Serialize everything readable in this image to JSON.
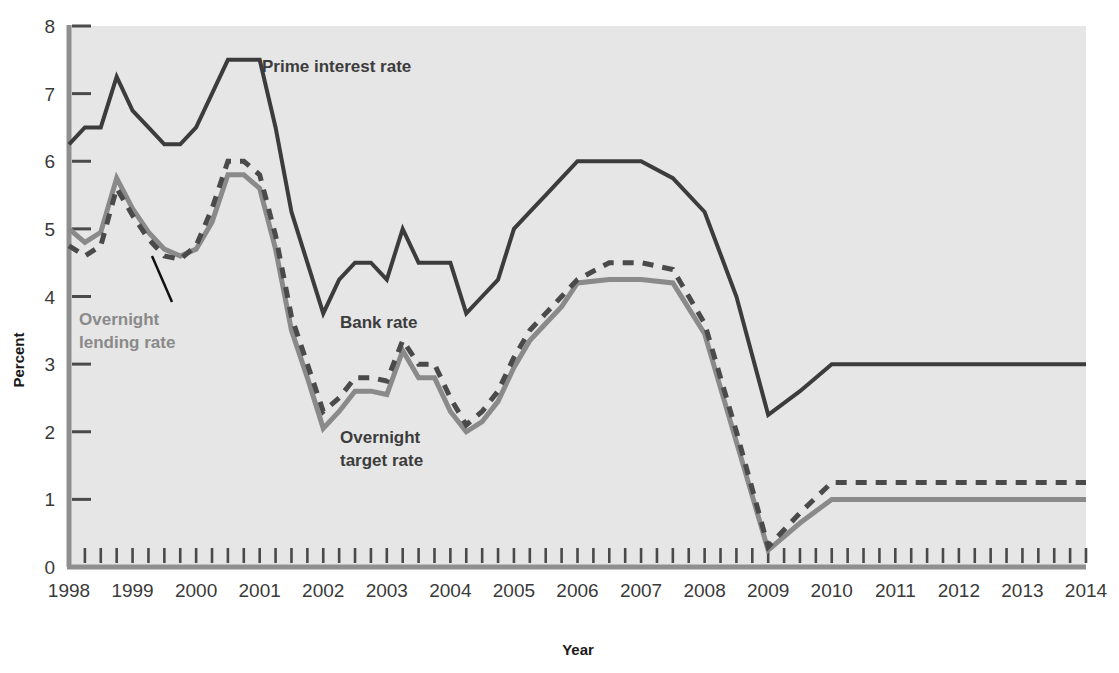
{
  "chart_data": {
    "type": "line",
    "title": "",
    "xlabel": "Year",
    "ylabel": "Percent",
    "xlim": [
      1998,
      2014
    ],
    "ylim": [
      0,
      8
    ],
    "yticks": [
      0,
      1,
      2,
      3,
      4,
      5,
      6,
      7,
      8
    ],
    "xticks": [
      1998,
      1999,
      2000,
      2001,
      2002,
      2003,
      2004,
      2005,
      2006,
      2007,
      2008,
      2009,
      2010,
      2011,
      2012,
      2013,
      2014
    ],
    "xtick_labels": [
      "1998",
      "1999",
      "2000",
      "2001",
      "2002",
      "2003",
      "2004",
      "2005",
      "2006",
      "2007",
      "2008",
      "2009",
      "2010",
      "2011",
      "2012",
      "2013",
      "2014"
    ],
    "ytick_labels": [
      "0",
      "1",
      "2",
      "3",
      "4",
      "5",
      "6",
      "7",
      "8"
    ],
    "minor_xticks_per_year": 4,
    "grid": false,
    "legend_position": "inline-annotations",
    "plot_background": "#e6e6e6",
    "series": [
      {
        "name": "Prime interest rate",
        "style": "solid",
        "color": "#3c3c3c",
        "width": 4,
        "x": [
          1998.0,
          1998.25,
          1998.5,
          1998.75,
          1999.0,
          1999.25,
          1999.5,
          1999.75,
          2000.0,
          2000.25,
          2000.5,
          2000.75,
          2001.0,
          2001.25,
          2001.5,
          2001.75,
          2002.0,
          2002.25,
          2002.5,
          2002.75,
          2003.0,
          2003.25,
          2003.5,
          2003.75,
          2004.0,
          2004.25,
          2004.5,
          2004.75,
          2005.0,
          2005.25,
          2005.5,
          2005.75,
          2006.0,
          2006.5,
          2007.0,
          2007.5,
          2008.0,
          2008.5,
          2009.0,
          2009.5,
          2010.0,
          2014.0
        ],
        "y": [
          6.25,
          6.5,
          6.5,
          7.25,
          6.75,
          6.5,
          6.25,
          6.25,
          6.5,
          7.0,
          7.5,
          7.5,
          7.5,
          6.5,
          5.25,
          4.5,
          3.75,
          4.25,
          4.5,
          4.5,
          4.25,
          5.0,
          4.5,
          4.5,
          4.5,
          3.75,
          4.0,
          4.25,
          5.0,
          5.25,
          5.5,
          5.75,
          6.0,
          6.0,
          6.0,
          5.75,
          5.25,
          4.0,
          2.25,
          2.6,
          3.0,
          3.0
        ]
      },
      {
        "name": "Bank rate",
        "style": "dashed",
        "color": "#4a4a4a",
        "width": 5,
        "x": [
          1998.0,
          1998.25,
          1998.5,
          1998.75,
          1999.0,
          1999.25,
          1999.5,
          1999.75,
          2000.0,
          2000.25,
          2000.5,
          2000.75,
          2001.0,
          2001.25,
          2001.5,
          2001.75,
          2002.0,
          2002.25,
          2002.5,
          2002.75,
          2003.0,
          2003.25,
          2003.5,
          2003.75,
          2004.0,
          2004.25,
          2004.5,
          2004.75,
          2005.0,
          2005.25,
          2005.5,
          2005.75,
          2006.0,
          2006.5,
          2007.0,
          2007.5,
          2008.0,
          2008.5,
          2009.0,
          2009.5,
          2010.0,
          2014.0
        ],
        "y": [
          4.75,
          4.6,
          4.75,
          5.6,
          5.2,
          4.85,
          4.6,
          4.55,
          4.75,
          5.3,
          6.0,
          6.0,
          5.8,
          4.9,
          3.7,
          3.0,
          2.3,
          2.5,
          2.8,
          2.8,
          2.75,
          3.35,
          3.0,
          3.0,
          2.5,
          2.1,
          2.3,
          2.6,
          3.1,
          3.5,
          3.75,
          4.0,
          4.25,
          4.5,
          4.5,
          4.4,
          3.6,
          2.0,
          0.3,
          0.8,
          1.25,
          1.25
        ]
      },
      {
        "name": "Overnight lending rate",
        "style": "solid",
        "color": "#8a8a8a",
        "width": 5,
        "x": [
          1998.0,
          1998.25,
          1998.5,
          1998.75,
          1999.0,
          1999.25,
          1999.5,
          1999.75,
          2000.0,
          2000.25,
          2000.5,
          2000.75,
          2001.0,
          2001.25,
          2001.5,
          2001.75,
          2002.0,
          2002.25,
          2002.5,
          2002.75,
          2003.0,
          2003.25,
          2003.5,
          2003.75,
          2004.0,
          2004.25,
          2004.5,
          2004.75,
          2005.0,
          2005.25,
          2005.5,
          2005.75,
          2006.0,
          2006.5,
          2007.0,
          2007.5,
          2008.0,
          2008.5,
          2009.0,
          2009.5,
          2010.0,
          2014.0
        ],
        "y": [
          5.0,
          4.8,
          4.95,
          5.75,
          5.3,
          4.95,
          4.7,
          4.6,
          4.7,
          5.1,
          5.8,
          5.8,
          5.6,
          4.7,
          3.5,
          2.8,
          2.05,
          2.3,
          2.6,
          2.6,
          2.55,
          3.2,
          2.8,
          2.8,
          2.3,
          2.0,
          2.15,
          2.45,
          2.95,
          3.35,
          3.6,
          3.85,
          4.2,
          4.25,
          4.25,
          4.2,
          3.45,
          1.85,
          0.25,
          0.65,
          1.0,
          1.0
        ]
      }
    ],
    "annotations": [
      {
        "text": "Prime interest rate",
        "color": "#3c3c3c",
        "x": 262,
        "y": 72
      },
      {
        "text": "Overnight",
        "color": "#8a8a8a",
        "x": 79,
        "y": 325
      },
      {
        "text": "lending rate",
        "color": "#8a8a8a",
        "x": 79,
        "y": 348
      },
      {
        "text": "Bank rate",
        "color": "#3c3c3c",
        "x": 340,
        "y": 328
      },
      {
        "text": "Overnight",
        "color": "#3c3c3c",
        "x": 340,
        "y": 443
      },
      {
        "text": "target rate",
        "color": "#3c3c3c",
        "x": 340,
        "y": 466
      }
    ]
  },
  "axis": {
    "y_title": "Percent",
    "x_title": "Year"
  }
}
